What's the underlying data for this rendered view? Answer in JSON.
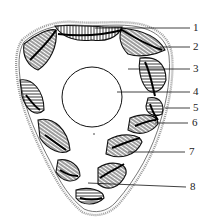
{
  "figure": {
    "type": "cross-section diagram",
    "ink_color": "#1a1a1a",
    "background": "#ffffff",
    "labels": [
      {
        "id": "1",
        "text": "1",
        "y": 28,
        "line_from_x": 95
      },
      {
        "id": "2",
        "text": "2",
        "y": 47,
        "line_from_x": 160
      },
      {
        "id": "3",
        "text": "3",
        "y": 69,
        "line_from_x": 128
      },
      {
        "id": "4",
        "text": "4",
        "y": 92,
        "line_from_x": 117
      },
      {
        "id": "5",
        "text": "5",
        "y": 108,
        "line_from_x": 165
      },
      {
        "id": "6",
        "text": "6",
        "y": 123,
        "line_from_x": 155
      },
      {
        "id": "7",
        "text": "7",
        "y": 152,
        "line_from_x": 128
      },
      {
        "id": "8",
        "text": "8",
        "y": 187,
        "line_from_x": 88
      }
    ]
  }
}
